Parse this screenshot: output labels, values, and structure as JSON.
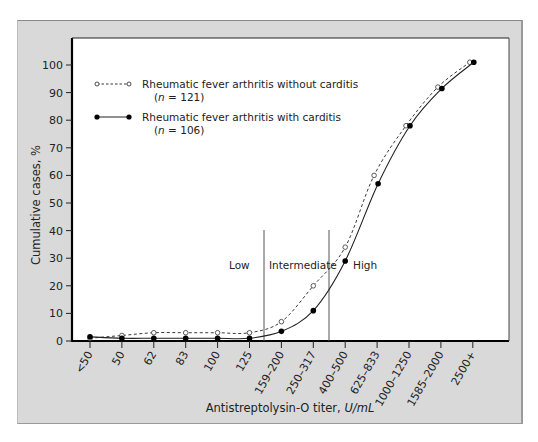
{
  "chart_data": {
    "type": "line",
    "title": "",
    "xlabel": "Antistreptolysin-O titer, ",
    "xlabel_unit": "U/mL",
    "ylabel": "Cumulative cases, %",
    "ylim": [
      0,
      100
    ],
    "yticks": [
      0,
      10,
      20,
      30,
      40,
      50,
      60,
      70,
      80,
      90,
      100
    ],
    "grid": false,
    "legend_position": "upper-left",
    "categories": [
      "<50",
      "50",
      "62",
      "83",
      "100",
      "125",
      "159–200",
      "250–317",
      "400–500",
      "625–833",
      "1000–1250",
      "1585–2000",
      "2500+"
    ],
    "series": [
      {
        "name": "Rheumatic fever arthritis without carditis",
        "n_label": "(n = 121)",
        "n_value": "121",
        "style": "dashed",
        "marker": "open-circle",
        "values": [
          1,
          2,
          3,
          3,
          3,
          3,
          7,
          20,
          34,
          60,
          78,
          92,
          101
        ]
      },
      {
        "name": "Rheumatic fever arthritis with carditis",
        "n_label": "(n = 106)",
        "n_value": "106",
        "style": "solid",
        "marker": "filled-circle",
        "values": [
          1.5,
          1,
          1,
          1,
          1,
          1,
          3.5,
          11,
          29,
          57,
          78,
          91.5,
          101
        ]
      }
    ],
    "annotations": [
      {
        "label": "Low",
        "region": "below 125–159"
      },
      {
        "label": "Intermediate",
        "region": "between ~140 and ~333"
      },
      {
        "label": "High",
        "region": "above ~333"
      }
    ],
    "region_dividers_between": [
      [
        "125",
        "159–200"
      ],
      [
        "250–317",
        "400–500"
      ]
    ]
  },
  "legend": {
    "without_label": "Rheumatic fever arthritis without carditis",
    "without_n_prefix": "(",
    "without_n_var": "n",
    "without_n_rest": " = 121)",
    "with_label": "Rheumatic fever arthritis with carditis",
    "with_n_prefix": "(",
    "with_n_var": "n",
    "with_n_rest": " = 106)"
  },
  "regions": {
    "low": "Low",
    "intermediate": "Intermediate",
    "high": "High"
  },
  "axes": {
    "x_title": "Antistreptolysin-O titer, ",
    "x_unit": "U/mL",
    "y_title": "Cumulative cases, %"
  },
  "colors": {
    "frame": "#d9d9d9",
    "plot_bg": "#ffffff",
    "ink": "#111111",
    "divider": "#555555"
  }
}
